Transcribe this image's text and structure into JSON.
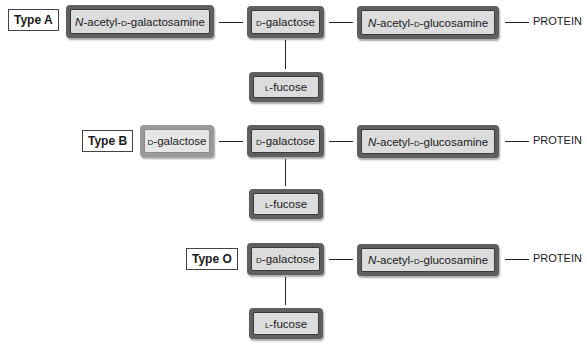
{
  "diagram": {
    "title": "",
    "rows": [
      {
        "type_label": "Type A",
        "chain": [
          {
            "prefix_italic": "N",
            "text": "-acetyl-",
            "sc": "d",
            "rest": "-galactosamine"
          },
          {
            "sc": "d",
            "rest": "-galactose"
          },
          {
            "prefix_italic": "N",
            "text": "-acetyl-",
            "sc": "d",
            "rest": "-glucosamine"
          }
        ],
        "branch": {
          "sc": "l",
          "rest": "-fucose"
        },
        "terminal": "PROTEIN"
      },
      {
        "type_label": "Type B",
        "chain": [
          {
            "sc": "d",
            "rest": "-galactose"
          },
          {
            "sc": "d",
            "rest": "-galactose"
          },
          {
            "prefix_italic": "N",
            "text": "-acetyl-",
            "sc": "d",
            "rest": "-glucosamine"
          }
        ],
        "branch": {
          "sc": "l",
          "rest": "-fucose"
        },
        "terminal": "PROTEIN"
      },
      {
        "type_label": "Type O",
        "chain": [
          {
            "sc": "d",
            "rest": "-galactose"
          },
          {
            "prefix_italic": "N",
            "text": "-acetyl-",
            "sc": "d",
            "rest": "-glucosamine"
          }
        ],
        "branch": {
          "sc": "l",
          "rest": "-fucose"
        },
        "terminal": "PROTEIN"
      }
    ],
    "colors": {
      "box_border": "#5f5f5f",
      "box_fill": "#dcdcdc",
      "light_box_border": "#9a9a9a",
      "line": "#222222"
    }
  }
}
